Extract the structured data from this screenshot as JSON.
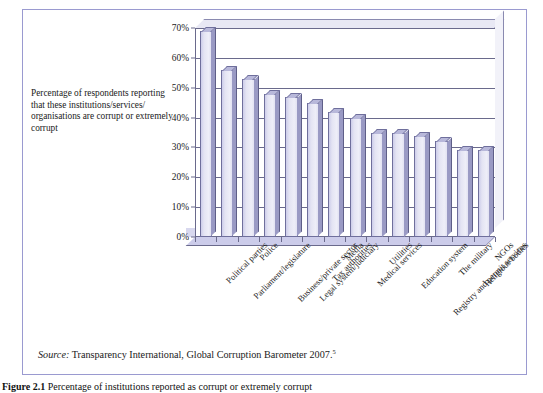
{
  "figure": {
    "axis_caption": "Percentage of respondents reporting that these institutions/services/ organisations are corrupt or extremely corrupt",
    "source_prefix": "Source:",
    "source_text": " Transparency International, Global Corruption Barometer 2007.",
    "source_footnote": "5",
    "caption_label": "Figure 2.1",
    "caption_text": "  Percentage of institutions reported as corrupt or extremely corrupt"
  },
  "colors": {
    "frame_border": "#9a9ad0",
    "bar_face": "#e4e4f3",
    "bar_side": "#9a9ac4",
    "bar_top": "#b8b8da",
    "bar_outline": "#6f6f9c",
    "axis_line": "#6a6a8c",
    "floor": "#ccccea",
    "text": "#1a1a1a"
  },
  "chart_data": {
    "type": "bar",
    "title": "",
    "xlabel": "",
    "ylabel": "Percentage of respondents reporting that these institutions/services/organisations are corrupt or extremely corrupt",
    "ylim": [
      0,
      70
    ],
    "ytick_values": [
      0,
      10,
      20,
      30,
      40,
      50,
      60,
      70
    ],
    "ytick_labels": [
      "0%",
      "10%",
      "20%",
      "30%",
      "40%",
      "50%",
      "60%",
      "70%"
    ],
    "grid": true,
    "legend": false,
    "categories": [
      "Political parties",
      "Parliament/legislature",
      "Police",
      "Business/private sector",
      "Legal system/judiciary",
      "Tax authorities",
      "Media",
      "Medical services",
      "Utilities",
      "Education system",
      "Registry and permit services",
      "The military",
      "Religious bodies",
      "NGOs"
    ],
    "values": [
      69,
      56,
      53,
      48,
      47,
      45,
      42,
      40,
      35,
      35,
      34,
      32,
      29,
      29
    ]
  }
}
